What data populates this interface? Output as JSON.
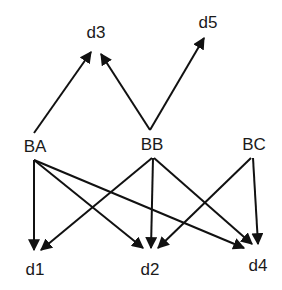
{
  "diagram": {
    "type": "directed-graph",
    "colors": {
      "line": "#111111",
      "text": "#1a1a1a",
      "background": "#ffffff"
    },
    "nodes": [
      {
        "id": "d3",
        "label": "d3",
        "x": 96,
        "y": 38
      },
      {
        "id": "d5",
        "label": "d5",
        "x": 208,
        "y": 28
      },
      {
        "id": "BA",
        "label": "BA",
        "x": 35,
        "y": 152
      },
      {
        "id": "BB",
        "label": "BB",
        "x": 152,
        "y": 150
      },
      {
        "id": "BC",
        "label": "BC",
        "x": 254,
        "y": 150
      },
      {
        "id": "d1",
        "label": "d1",
        "x": 35,
        "y": 275
      },
      {
        "id": "d2",
        "label": "d2",
        "x": 150,
        "y": 275
      },
      {
        "id": "d4",
        "label": "d4",
        "x": 258,
        "y": 271
      }
    ],
    "edges": [
      {
        "from": "BA",
        "to": "d3"
      },
      {
        "from": "BB",
        "to": "d3"
      },
      {
        "from": "BB",
        "to": "d5"
      },
      {
        "from": "BA",
        "to": "d1"
      },
      {
        "from": "BA",
        "to": "d2"
      },
      {
        "from": "BA",
        "to": "d4"
      },
      {
        "from": "BB",
        "to": "d1"
      },
      {
        "from": "BB",
        "to": "d2"
      },
      {
        "from": "BB",
        "to": "d4"
      },
      {
        "from": "BC",
        "to": "d2"
      },
      {
        "from": "BC",
        "to": "d4"
      }
    ]
  }
}
